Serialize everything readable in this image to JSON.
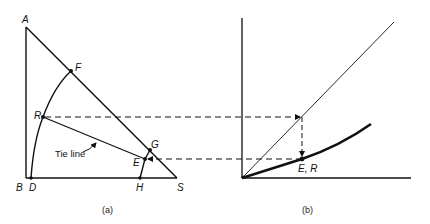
{
  "figure": {
    "panel_a": {
      "caption": "(a)",
      "points": {
        "A": "A",
        "B": "B",
        "D": "D",
        "H": "H",
        "S": "S",
        "F": "F",
        "R": "R",
        "G": "G",
        "E": "E"
      },
      "annotation": "Tie line"
    },
    "panel_b": {
      "caption": "(b)",
      "point_label": "E, R"
    },
    "colors": {
      "ink": "#111111",
      "background": "#ffffff"
    }
  }
}
